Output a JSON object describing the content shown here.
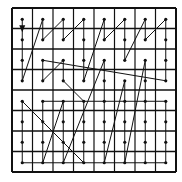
{
  "diagram": {
    "type": "scan-pattern-grid",
    "grid": {
      "rows": 8,
      "cols": 8,
      "left": 12,
      "top": 8,
      "cell": 20.5
    },
    "colors": {
      "line": "#111111",
      "background": "#ffffff"
    },
    "start_marker": "arrow-down",
    "path": [
      [
        0,
        0
      ],
      [
        0,
        1
      ],
      [
        0,
        2
      ],
      [
        0,
        3
      ],
      [
        1,
        0
      ],
      [
        1,
        1
      ],
      [
        2,
        0
      ],
      [
        2,
        1
      ],
      [
        3,
        0
      ],
      [
        3,
        1
      ],
      [
        3,
        2
      ],
      [
        3,
        3
      ],
      [
        4,
        0
      ],
      [
        4,
        1
      ],
      [
        5,
        0
      ],
      [
        5,
        1
      ],
      [
        5,
        2
      ],
      [
        6,
        0
      ],
      [
        6,
        1
      ],
      [
        7,
        0
      ],
      [
        7,
        1
      ],
      [
        7,
        2
      ],
      [
        7,
        3
      ],
      [
        1,
        2
      ],
      [
        1,
        3
      ],
      [
        2,
        2
      ],
      [
        2,
        3
      ],
      [
        3,
        4
      ],
      [
        3,
        5
      ],
      [
        3,
        6
      ],
      [
        3,
        7
      ],
      [
        0,
        4
      ],
      [
        0,
        5
      ],
      [
        0,
        6
      ],
      [
        0,
        7
      ],
      [
        7,
        7
      ],
      [
        7,
        6
      ],
      [
        7,
        5
      ],
      [
        7,
        4
      ],
      [
        1,
        4
      ],
      [
        1,
        5
      ],
      [
        1,
        6
      ],
      [
        1,
        7
      ],
      [
        2,
        4
      ],
      [
        2,
        5
      ],
      [
        2,
        6
      ],
      [
        2,
        7
      ],
      [
        4,
        2
      ],
      [
        4,
        3
      ],
      [
        4,
        4
      ],
      [
        4,
        5
      ],
      [
        4,
        6
      ],
      [
        4,
        7
      ],
      [
        5,
        3
      ],
      [
        5,
        4
      ],
      [
        5,
        5
      ],
      [
        5,
        6
      ],
      [
        5,
        7
      ],
      [
        6,
        2
      ],
      [
        6,
        3
      ],
      [
        6,
        4
      ],
      [
        6,
        5
      ],
      [
        6,
        6
      ],
      [
        6,
        7
      ]
    ]
  }
}
